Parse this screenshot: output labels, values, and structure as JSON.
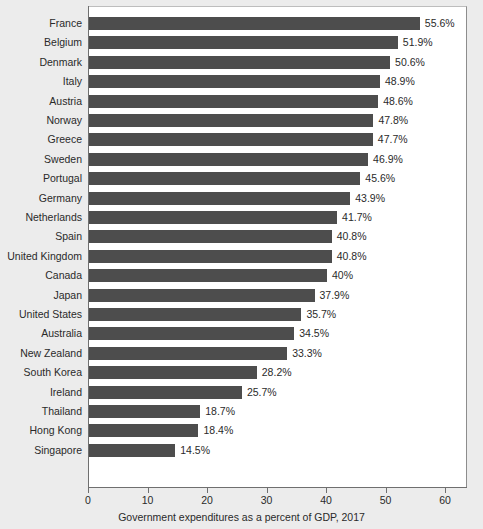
{
  "chart_data": {
    "type": "bar",
    "orientation": "horizontal",
    "title": "",
    "xlabel": "Government expenditures as a percent of GDP, 2017",
    "ylabel": "",
    "xlim": [
      0,
      60
    ],
    "xticks": [
      0,
      10,
      20,
      30,
      40,
      50,
      60
    ],
    "xtick_labels": [
      "0",
      "10",
      "20",
      "30",
      "40",
      "50",
      "60"
    ],
    "grid": false,
    "legend": null,
    "bar_color": "#4d4d4d",
    "plot_background": "#ffffff",
    "figure_background": "#ececec",
    "categories": [
      "France",
      "Belgium",
      "Denmark",
      "Italy",
      "Austria",
      "Norway",
      "Greece",
      "Sweden",
      "Portugal",
      "Germany",
      "Netherlands",
      "Spain",
      "United Kingdom",
      "Canada",
      "Japan",
      "United States",
      "Australia",
      "New Zealand",
      "South Korea",
      "Ireland",
      "Thailand",
      "Hong Kong",
      "Singapore"
    ],
    "values": [
      55.6,
      51.9,
      50.6,
      48.9,
      48.6,
      47.8,
      47.7,
      46.9,
      45.6,
      43.9,
      41.7,
      40.8,
      40.8,
      40,
      37.9,
      35.7,
      34.5,
      33.3,
      28.2,
      25.7,
      18.7,
      18.4,
      14.5
    ],
    "value_labels": [
      "55.6%",
      "51.9%",
      "50.6%",
      "48.9%",
      "48.6%",
      "47.8%",
      "47.7%",
      "46.9%",
      "45.6%",
      "43.9%",
      "41.7%",
      "40.8%",
      "40.8%",
      "40%",
      "37.9%",
      "35.7%",
      "34.5%",
      "33.3%",
      "28.2%",
      "25.7%",
      "18.7%",
      "18.4%",
      "14.5%"
    ]
  }
}
